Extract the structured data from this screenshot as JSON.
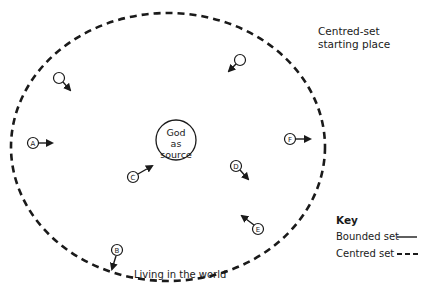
{
  "diagram": {
    "corner_label": [
      "Centred-set",
      "starting place"
    ],
    "center_label": [
      "God",
      "as",
      "source"
    ],
    "bottom_label": "Living in the world",
    "nodes": [
      {
        "id": "unlabeled-1",
        "label": "",
        "x": 59,
        "y": 78,
        "arrow_dir": "down-right"
      },
      {
        "id": "unlabeled-2",
        "label": "",
        "x": 240,
        "y": 60,
        "arrow_dir": "down-left"
      },
      {
        "id": "A",
        "label": "A",
        "x": 33,
        "y": 143,
        "arrow_dir": "right"
      },
      {
        "id": "B",
        "label": "B",
        "x": 117,
        "y": 250,
        "arrow_dir": "down"
      },
      {
        "id": "C",
        "label": "C",
        "x": 133,
        "y": 177,
        "arrow_dir": "up-right"
      },
      {
        "id": "D",
        "label": "D",
        "x": 236,
        "y": 166,
        "arrow_dir": "down-right"
      },
      {
        "id": "E",
        "label": "E",
        "x": 258,
        "y": 229,
        "arrow_dir": "up-left"
      },
      {
        "id": "F",
        "label": "F",
        "x": 290,
        "y": 139,
        "arrow_dir": "right"
      }
    ],
    "key": {
      "title": "Key",
      "items": [
        {
          "label": "Bounded set",
          "line_style": "solid"
        },
        {
          "label": "Centred set",
          "line_style": "dashed"
        }
      ]
    },
    "colors": {
      "line": "#1a1a1a",
      "background": "#ffffff"
    }
  }
}
